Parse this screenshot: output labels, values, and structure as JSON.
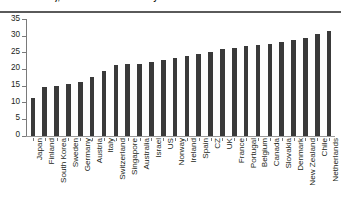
{
  "chart_data": {
    "type": "bar",
    "title": "standardised), 2014 or latest available year",
    "xlabel": "",
    "ylabel": "",
    "ylim": [
      0,
      35
    ],
    "yticks": [
      0,
      5,
      10,
      15,
      20,
      25,
      30,
      35
    ],
    "grid": false,
    "legend": null,
    "bar_color": "#3a3a3a",
    "categories": [
      "Japan",
      "Finland",
      "South Korea",
      "Sweden",
      "Germany",
      "Austria",
      "Italy",
      "Switzerland",
      "Singapore",
      "Australia",
      "Israel",
      "US",
      "Norway",
      "Ireland",
      "Spain",
      "CZ",
      "UK",
      "France",
      "Portugal",
      "Belgium",
      "Canada",
      "Slovakia",
      "Denmark",
      "New Zealand",
      "Chile",
      "Netherlands"
    ],
    "values": [
      11.4,
      14.6,
      15.0,
      15.6,
      16.1,
      17.7,
      19.3,
      21.2,
      21.4,
      21.6,
      22.2,
      22.8,
      23.4,
      24.0,
      24.6,
      25.2,
      26.1,
      26.4,
      26.9,
      27.2,
      27.6,
      28.1,
      28.6,
      29.3,
      30.6,
      31.5
    ]
  }
}
